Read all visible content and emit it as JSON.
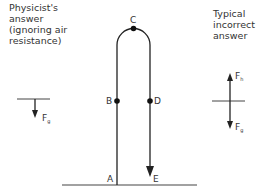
{
  "captions": {
    "left": "Physicist's\nanswer\n(ignoring air\nresistance)",
    "right": "Typical\nincorrect\nanswer"
  },
  "points": {
    "A": "A",
    "B": "B",
    "C": "C",
    "D": "D",
    "E": "E"
  },
  "forces": {
    "physicist": {
      "label": "F",
      "subscript": "g"
    },
    "incorrect_up": {
      "label": "F",
      "subscript": "h"
    },
    "incorrect_down": {
      "label": "F",
      "subscript": "g"
    }
  },
  "colors": {
    "line": "#222222",
    "ground": "#444444",
    "text": "#333333"
  }
}
